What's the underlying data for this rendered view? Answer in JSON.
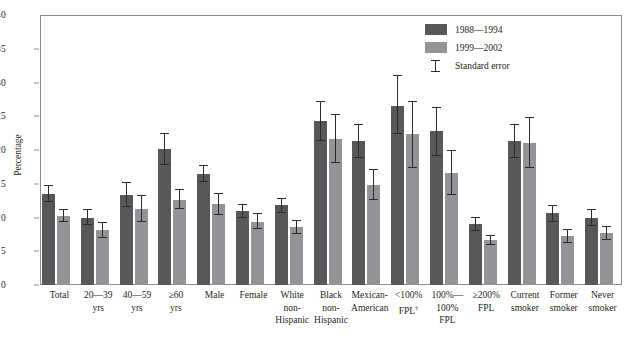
{
  "chart_data": {
    "type": "bar",
    "title": "",
    "xlabel": "",
    "ylabel": "Percentage",
    "ylim": [
      0,
      40
    ],
    "yticks": [
      0,
      5,
      10,
      15,
      20,
      25,
      30,
      35,
      40
    ],
    "grid": false,
    "legend_position": "top-right",
    "categories": [
      "Total",
      "20—39\nyrs",
      "40—59\nyrs",
      "≥60\nyrs",
      "Male",
      "Female",
      "White\nnon-\nHispanic",
      "Black\nnon-\nHispanic",
      "Mexican-\nAmerican",
      "<100%\nFPL†",
      "100%—\n100%\nFPL",
      "≥200%\nFPL",
      "Current\nsmoker",
      "Former\nsmoker",
      "Never\nsmoker"
    ],
    "series": [
      {
        "name": "1988—1994",
        "color": "#58585a",
        "values": [
          13.5,
          10.0,
          13.4,
          20.1,
          16.5,
          10.9,
          11.8,
          24.3,
          21.3,
          26.5,
          22.8,
          9.0,
          21.3,
          10.6,
          10.0
        ],
        "errors_low": [
          12.3,
          8.9,
          11.6,
          17.8,
          15.2,
          9.9,
          10.7,
          21.4,
          18.8,
          22.4,
          19.1,
          8.0,
          18.8,
          9.4,
          8.8
        ],
        "errors_high": [
          14.8,
          11.3,
          15.3,
          22.5,
          17.8,
          12.0,
          12.9,
          27.3,
          23.9,
          31.1,
          26.4,
          10.1,
          23.9,
          11.8,
          11.2
        ]
      },
      {
        "name": "1999—2002",
        "color": "#949498",
        "values": [
          10.2,
          8.1,
          11.3,
          12.6,
          12.0,
          9.4,
          8.6,
          21.7,
          14.8,
          22.4,
          16.6,
          6.6,
          21.1,
          7.2,
          7.7
        ],
        "errors_low": [
          9.3,
          6.9,
          9.4,
          11.2,
          10.4,
          8.3,
          7.6,
          18.1,
          12.6,
          17.4,
          13.4,
          5.9,
          17.4,
          6.2,
          6.7
        ],
        "errors_high": [
          11.2,
          9.4,
          13.3,
          14.2,
          13.7,
          10.6,
          9.6,
          25.4,
          17.2,
          27.2,
          20.0,
          7.4,
          24.9,
          8.3,
          8.8
        ]
      }
    ],
    "legend_entries": [
      {
        "label": "1988—1994",
        "type": "swatch",
        "color": "#58585a"
      },
      {
        "label": "1999—2002",
        "type": "swatch",
        "color": "#949498"
      },
      {
        "label": "Standard error",
        "type": "errorbar",
        "color": "#2b2b2b"
      }
    ]
  },
  "axis": {
    "y_title": "Percentage",
    "y_tick_labels": [
      "0",
      "5",
      "10",
      "15",
      "20",
      "25",
      "30",
      "35",
      "40"
    ]
  },
  "colors": {
    "series_1988_1994": "#58585a",
    "series_1999_2002": "#949498",
    "error_bar": "#2b2b2b",
    "frame": "#8c8c8c",
    "text": "#231f20",
    "background": "#ffffff"
  }
}
